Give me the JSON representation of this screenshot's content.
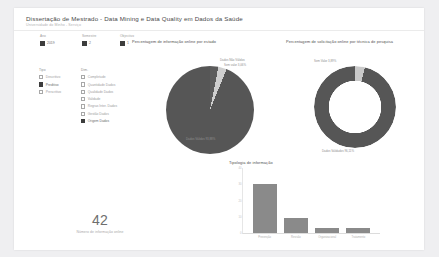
{
  "report": {
    "title": "Dissertação de Mestrado - Data Mining e Data Quality em Dados da Saúde",
    "subtitle": "Universidade do Minho - Serviço"
  },
  "slicers": [
    {
      "name": "ano",
      "title": "Ano",
      "value": "2019",
      "checked": true
    },
    {
      "name": "semestre",
      "title": "Semestre",
      "value": "2",
      "checked": true
    },
    {
      "name": "objectivo",
      "title": "Objectivo",
      "value": "1",
      "checked": true
    }
  ],
  "filters": [
    {
      "name": "tipo",
      "title": "Tipo",
      "items": [
        {
          "label": "Descritivo",
          "checked": false
        },
        {
          "label": "Preditivo",
          "checked": true
        },
        {
          "label": "Prescritivo",
          "checked": false
        }
      ]
    },
    {
      "name": "dimensao",
      "title": "Dim.",
      "items": [
        {
          "label": "Completude",
          "checked": false
        },
        {
          "label": "Quantidade Dados",
          "checked": false
        },
        {
          "label": "Qualidade Dados",
          "checked": false
        },
        {
          "label": "Validade",
          "checked": false
        },
        {
          "label": "Regras Inter. Dados",
          "checked": false
        },
        {
          "label": "Gestão Dados",
          "checked": false
        },
        {
          "label": "Origem Dados",
          "checked": true
        }
      ]
    }
  ],
  "kpi": {
    "value": "42",
    "caption": "Número de informação online"
  },
  "chart_data": [
    {
      "name": "pie",
      "type": "pie",
      "title": "Percentagem de informação online por estado",
      "categories": [
        "Dados Não Válidos",
        "Sem Valor",
        "Dados Válidos"
      ],
      "values": [
        3.06,
        3.06,
        93.88
      ],
      "labels": [
        "Dados Não Válidos",
        "Sem valor 3,06%",
        "Dados Válidos 93,88%"
      ],
      "colors": [
        "#5c5c5c",
        "#cfcfcf",
        "#565656"
      ],
      "legend": "none"
    },
    {
      "name": "donut",
      "type": "pie",
      "title": "Percentagem de solicitação online por técnica de pesquisa",
      "categories": [
        "Sem Valor",
        "Dados Validados"
      ],
      "values": [
        3.89,
        96.11
      ],
      "labels": [
        "Sem Valor 3,89%",
        "Dados Validados 96,11%"
      ],
      "colors": [
        "#c9c9c9",
        "#565656"
      ],
      "legend": "none"
    },
    {
      "name": "bar",
      "type": "bar",
      "title": "Tipologia de informação",
      "categories": [
        "Prevenção",
        "Revisão",
        "Organizacional",
        "Tratamento"
      ],
      "values": [
        30,
        9,
        3,
        3
      ],
      "xlabel": "",
      "ylabel": "",
      "ylim": [
        0,
        40
      ],
      "yticks": [
        "40",
        "30",
        "20",
        "10",
        "0"
      ],
      "grid": false,
      "color": "#8a8a8a"
    }
  ]
}
